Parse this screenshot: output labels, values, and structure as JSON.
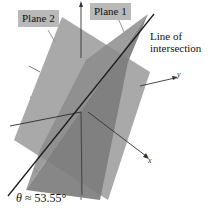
{
  "figure": {
    "labels": {
      "plane1": "Plane 1",
      "plane2": "Plane 2",
      "intersection_line1": "Line of",
      "intersection_line2": "intersection",
      "angle_symbol": "θ",
      "angle_text": " ≈ 53.55°"
    },
    "axes": {
      "x": "x",
      "y": "y",
      "z": ""
    },
    "colors": {
      "plane1": "#7d7d7d",
      "plane2": "#a9a9a9",
      "overlap": "#8f8f8f",
      "callout_bg": "#b9b9b9",
      "line": "#1e1e1e"
    }
  }
}
